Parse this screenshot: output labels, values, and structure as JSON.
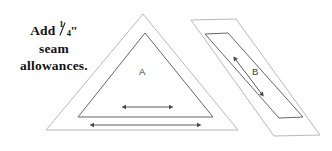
{
  "canvas": {
    "width": 332,
    "height": 151,
    "background": "#ffffff"
  },
  "instruction": {
    "line1_before": "Add ",
    "fraction_numerator": "1",
    "fraction_denominator": "4",
    "inch_mark": "\"",
    "line2": "seam",
    "line3": "allowances.",
    "full_text": "Add 1/4\" seam allowances.",
    "color": "#111111"
  },
  "shapes": {
    "triangle": {
      "label": "A",
      "label_color": "#3a3a3a",
      "outer_color": "#b9b9b9",
      "inner_color": "#555555",
      "outer_points": "143,14 238,130 46,130",
      "inner_points": "145,33 213,117 78,117",
      "description": "nested triangle template with seam allowance"
    },
    "parallelogram": {
      "label": "B",
      "label_color": "#3a3a3a",
      "outer_color": "#b9b9b9",
      "inner_color": "#555555",
      "outer_points": "191,20 236,19 320,135 274,136",
      "inner_points": "205,34 228,33 303,117 279,118",
      "description": "nested slanted parallelogram template with seam allowance"
    }
  },
  "arrows": {
    "color": "#4a4a4a",
    "items": [
      {
        "name": "triangle-inner-width-arrow",
        "x1": 126,
        "y1": 107,
        "x2": 169,
        "y2": 107,
        "orientation": "horizontal",
        "double_headed": true
      },
      {
        "name": "triangle-outer-width-arrow",
        "x1": 94,
        "y1": 125,
        "x2": 197,
        "y2": 125,
        "orientation": "horizontal",
        "double_headed": true
      },
      {
        "name": "parallelogram-length-arrow",
        "x1": 236,
        "y1": 60,
        "x2": 261,
        "y2": 93,
        "orientation": "diagonal",
        "double_headed": true
      }
    ]
  }
}
